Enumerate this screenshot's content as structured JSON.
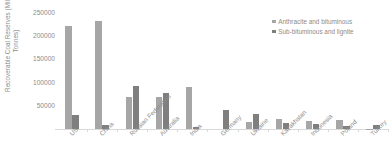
{
  "chart_data": {
    "type": "bar",
    "title": "",
    "xlabel": "",
    "ylabel": "Recoverable Coal Reserves (Million Tonnes)",
    "ylim": [
      0,
      250000
    ],
    "ytick_values": [
      50000,
      100000,
      150000,
      200000,
      250000
    ],
    "ytick_labels": [
      "50000",
      "100000",
      "150000",
      "200000",
      "250000"
    ],
    "grid": false,
    "legend_position": "top-right",
    "categories": [
      "US",
      "China",
      "Russian Federation",
      "Australia",
      "India",
      "Germany",
      "Ukraine",
      "Kazakhstan",
      "Indonesia",
      "Poland",
      "Turkey"
    ],
    "series": [
      {
        "name": "Anthracite and bituminous",
        "color": "#a6a6a6",
        "values": [
          220000,
          230000,
          69000,
          68000,
          90000,
          99,
          15000,
          21500,
          17000,
          20000,
          500
        ]
      },
      {
        "name": "Sub-bituminous and lignite",
        "color": "#7f7f7f",
        "values": [
          30000,
          8000,
          91000,
          76000,
          4500,
          40000,
          33000,
          12500,
          11000,
          5500,
          8500
        ]
      }
    ]
  },
  "legend": {
    "items": [
      {
        "label": "Anthracite and bituminous",
        "color": "#a6a6a6"
      },
      {
        "label": "Sub-bituminous and lignite",
        "color": "#7f7f7f"
      }
    ]
  },
  "axis": {
    "y_title": "Recoverable Coal Reserves (Million Tonnes)"
  }
}
